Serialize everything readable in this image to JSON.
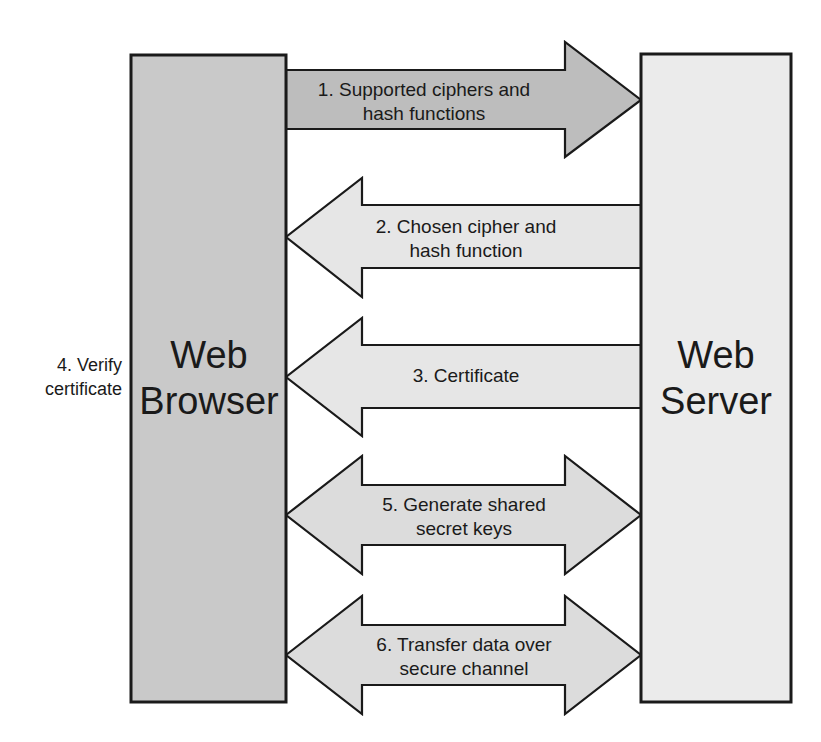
{
  "diagram": {
    "colors": {
      "browser_box_fill": "#c9c9c9",
      "server_box_fill": "#ebebeb",
      "arrow_fill_dark": "#bdbdbd",
      "arrow_fill_light": "#e6e6e6",
      "stroke": "#1a1a1a",
      "background": "#ffffff",
      "text": "#1a1a1a"
    },
    "nodes": [
      {
        "id": "web-browser",
        "label_line1": "Web",
        "label_line2": "Browser",
        "fill": "#c9c9c9",
        "x": 131,
        "y": 55,
        "width": 155,
        "height": 647
      },
      {
        "id": "web-server",
        "label_line1": "Web",
        "label_line2": "Server",
        "fill": "#ebebeb",
        "x": 641,
        "y": 54,
        "width": 150,
        "height": 648
      }
    ],
    "side_labels": [
      {
        "id": "verify-certificate",
        "line1": "4. Verify",
        "line2": "certificate",
        "x": 122,
        "y": 377
      }
    ],
    "arrows": [
      {
        "id": "arrow-1-supported-ciphers",
        "step": "1",
        "label_line1": "1. Supported ciphers and",
        "label_line2": "hash functions",
        "direction": "right",
        "fill": "#bdbdbd",
        "from": "web-browser",
        "to": "web-server",
        "shaft_top": 70,
        "shaft_bottom": 129,
        "head_top": 42,
        "head_bottom": 157,
        "tip_x": 641,
        "tail_x": 286,
        "head_base_x": 565,
        "label_x": 424,
        "label_y": 100
      },
      {
        "id": "arrow-2-chosen-cipher",
        "step": "2",
        "label_line1": "2. Chosen cipher and",
        "label_line2": "hash function",
        "direction": "left",
        "fill": "#e6e6e6",
        "from": "web-server",
        "to": "web-browser",
        "shaft_top": 205,
        "shaft_bottom": 268,
        "head_top": 178,
        "head_bottom": 297,
        "tip_x": 286,
        "tail_x": 641,
        "head_base_x": 362,
        "label_x": 466,
        "label_y": 237
      },
      {
        "id": "arrow-3-certificate",
        "step": "3",
        "label_line1": "3. Certificate",
        "label_line2": "",
        "direction": "left",
        "fill": "#e6e6e6",
        "from": "web-server",
        "to": "web-browser",
        "shaft_top": 345,
        "shaft_bottom": 408,
        "head_top": 318,
        "head_bottom": 436,
        "tip_x": 286,
        "tail_x": 641,
        "head_base_x": 362,
        "label_x": 466,
        "label_y": 377
      },
      {
        "id": "arrow-5-generate-shared-secret-keys",
        "step": "5",
        "label_line1": "5. Generate shared",
        "label_line2": "secret keys",
        "direction": "both",
        "fill": "#dcdcdc",
        "from": "web-browser",
        "to": "web-server",
        "shaft_top": 485,
        "shaft_bottom": 545,
        "head_top": 456,
        "head_bottom": 574,
        "tip_x": 641,
        "tail_x": 286,
        "head_base_x": 565,
        "head_base_left_x": 362,
        "label_x": 464,
        "label_y": 515
      },
      {
        "id": "arrow-6-transfer-data",
        "step": "6",
        "label_line1": "6. Transfer data over",
        "label_line2": "secure channel",
        "direction": "both",
        "fill": "#dcdcdc",
        "from": "web-browser",
        "to": "web-server",
        "shaft_top": 625,
        "shaft_bottom": 685,
        "head_top": 596,
        "head_bottom": 714,
        "tip_x": 641,
        "tail_x": 286,
        "head_base_x": 565,
        "head_base_left_x": 362,
        "label_x": 464,
        "label_y": 655
      }
    ]
  }
}
